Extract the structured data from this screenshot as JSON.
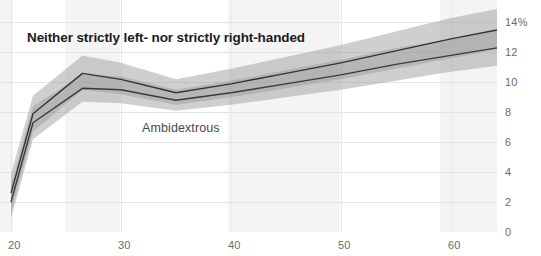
{
  "chart_data": {
    "type": "line",
    "title": "",
    "subtitle": "",
    "xlabel": "",
    "ylabel": "",
    "xlim": [
      19.0,
      64.2
    ],
    "ylim": [
      0,
      15.5
    ],
    "grid": true,
    "legend_position": "inline-annotations",
    "x_ticks": [
      20,
      30,
      40,
      50,
      60
    ],
    "x_tick_labels": [
      "20",
      "30",
      "40",
      "50",
      "60"
    ],
    "y_ticks": [
      0,
      2,
      4,
      6,
      8,
      10,
      12,
      14
    ],
    "y_tick_labels": [
      "0",
      "2",
      "4",
      "6",
      "8",
      "10",
      "12",
      "14%"
    ],
    "y_axis_side": "right",
    "annotations": [
      {
        "name": "neither-label",
        "text": "Neither strictly left- nor strictly right-handed",
        "x": 22.2,
        "y": 12.9
      },
      {
        "name": "ambidextrous-label",
        "text": "Ambidextrous",
        "x": 32.0,
        "y": 6.9
      }
    ],
    "x": [
      20.0,
      22.0,
      26.5,
      30.0,
      35.0,
      40.0,
      45.0,
      50.0,
      55.0,
      60.0,
      64.2
    ],
    "series": [
      {
        "name": "Neither strictly left- nor strictly right-handed",
        "color": "#333333",
        "band_color": "#9a9a9a",
        "values": [
          2.6,
          7.9,
          10.6,
          10.2,
          9.3,
          9.9,
          10.6,
          11.3,
          12.1,
          12.9,
          13.5
        ],
        "band_low": [
          1.3,
          6.7,
          9.5,
          9.2,
          8.5,
          9.0,
          9.6,
          10.2,
          10.9,
          11.6,
          12.2
        ],
        "band_high": [
          3.9,
          9.1,
          11.8,
          11.3,
          10.2,
          10.9,
          11.7,
          12.5,
          13.4,
          14.3,
          14.9
        ]
      },
      {
        "name": "Ambidextrous",
        "color": "#3a3a3a",
        "band_color": "#9a9a9a",
        "values": [
          2.0,
          7.3,
          9.6,
          9.5,
          8.8,
          9.3,
          9.9,
          10.5,
          11.2,
          11.8,
          12.3
        ],
        "band_low": [
          0.9,
          6.2,
          8.7,
          8.6,
          8.1,
          8.5,
          9.0,
          9.5,
          10.1,
          10.7,
          11.1
        ],
        "band_high": [
          3.1,
          8.4,
          10.5,
          10.4,
          9.5,
          10.1,
          10.8,
          11.5,
          12.3,
          12.9,
          13.5
        ]
      }
    ]
  },
  "background_bands": [
    {
      "x0": 0,
      "x1": 13
    },
    {
      "x0": 65,
      "x1": 120
    },
    {
      "x0": 228,
      "x1": 340
    },
    {
      "x0": 440,
      "x1": 497
    }
  ],
  "colors": {
    "grid": "#e3e3e3",
    "band_fill": "#f4f4f4",
    "tick_text": "#6b6b6b",
    "line_primary": "#333333",
    "ribbon": "#9a9a9a",
    "page_background": "#ffffff"
  }
}
